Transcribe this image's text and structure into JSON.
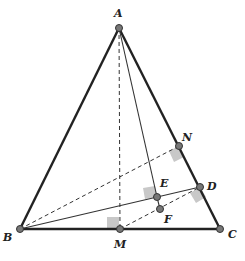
{
  "diagram": {
    "type": "geometry",
    "points": {
      "A": {
        "label": "A",
        "x": 119,
        "y": 28
      },
      "B": {
        "label": "B",
        "x": 20,
        "y": 229
      },
      "C": {
        "label": "C",
        "x": 220,
        "y": 229
      },
      "M": {
        "label": "M",
        "x": 120,
        "y": 229
      },
      "N": {
        "label": "N",
        "x": 179,
        "y": 146
      },
      "D": {
        "label": "D",
        "x": 200,
        "y": 187
      },
      "E": {
        "label": "E",
        "x": 157,
        "y": 197
      },
      "F": {
        "label": "F",
        "x": 160,
        "y": 209
      }
    },
    "segments": [
      {
        "from": "A",
        "to": "B",
        "style": "thick"
      },
      {
        "from": "A",
        "to": "C",
        "style": "thick"
      },
      {
        "from": "B",
        "to": "C",
        "style": "thick"
      },
      {
        "from": "A",
        "to": "M",
        "style": "dashed"
      },
      {
        "from": "B",
        "to": "N",
        "style": "dashed"
      },
      {
        "from": "B",
        "to": "D",
        "style": "solid"
      },
      {
        "from": "A",
        "to": "E",
        "style": "solid"
      },
      {
        "from": "E",
        "to": "F",
        "style": "solid"
      },
      {
        "from": "M",
        "to": "D",
        "style": "dashed"
      }
    ],
    "right_angle_marks": [
      "M",
      "N",
      "D",
      "E"
    ],
    "colors": {
      "line": "#222222",
      "point_fill": "#777777",
      "right_angle_fill": "#c8c8c8"
    }
  }
}
